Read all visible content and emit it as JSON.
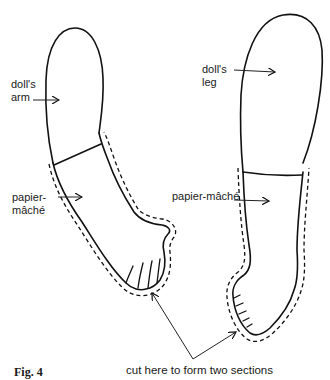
{
  "figure": {
    "caption": "Fig. 4",
    "instruction": "cut here to form two sections"
  },
  "arm": {
    "label": "doll's\narm",
    "material_label": "papier-\nmâché"
  },
  "leg": {
    "label": "doll's\nleg",
    "material_label": "papier-mâché"
  },
  "colors": {
    "line": "#111111",
    "background": "#ffffff"
  }
}
